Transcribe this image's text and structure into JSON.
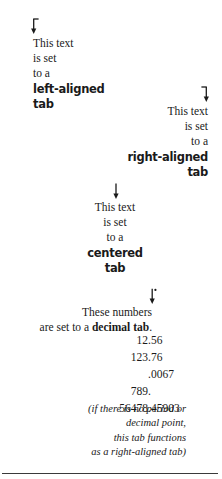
{
  "figure": {
    "colors": {
      "text": "#1a1a1a",
      "rule": "#3a3a3a",
      "background": "#ffffff"
    }
  },
  "left_tab": {
    "marker_icon": "left-aligned-tab-arrow-icon",
    "lines": [
      {
        "text": "This text",
        "bold": false
      },
      {
        "text": "is set",
        "bold": false
      },
      {
        "text": "to a",
        "bold": false
      },
      {
        "text": "left-aligned",
        "bold": true
      },
      {
        "text": "tab",
        "bold": true
      }
    ]
  },
  "right_tab": {
    "marker_icon": "right-aligned-tab-arrow-icon",
    "lines": [
      {
        "text": "This text",
        "bold": false
      },
      {
        "text": "is set",
        "bold": false
      },
      {
        "text": "to a",
        "bold": false
      },
      {
        "text": "right-aligned",
        "bold": true
      },
      {
        "text": "tab",
        "bold": true
      }
    ]
  },
  "center_tab": {
    "marker_icon": "centered-tab-arrow-icon",
    "lines": [
      {
        "text": "This text",
        "bold": false
      },
      {
        "text": "is set",
        "bold": false
      },
      {
        "text": "to a",
        "bold": false
      },
      {
        "text": "centered",
        "bold": true
      },
      {
        "text": "tab",
        "bold": true
      }
    ]
  },
  "decimal_tab": {
    "marker_icon": "decimal-tab-arrow-icon",
    "intro": {
      "line1": "These numbers",
      "line2_prefix": "are set to a ",
      "line2_bold": "decimal tab",
      "line2_suffix": "."
    },
    "numbers": [
      {
        "integer": "12",
        "fraction": ".56"
      },
      {
        "integer": "123",
        "fraction": ".76"
      },
      {
        "integer": "",
        "fraction": ".0067"
      },
      {
        "integer": "789",
        "fraction": "."
      },
      {
        "integer": "56478",
        "fraction": ".45903"
      }
    ],
    "note": [
      "(if there is no period or",
      "decimal point,",
      "this tab functions",
      "as a right-aligned tab)"
    ]
  }
}
